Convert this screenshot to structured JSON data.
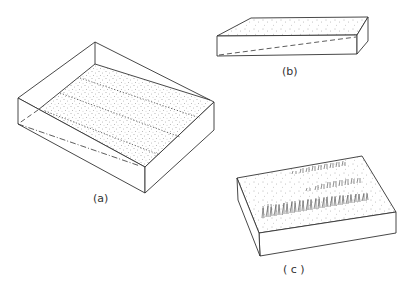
{
  "figure": {
    "panels": [
      {
        "id": "a",
        "label": "(a)",
        "description": "Block with stippled sloping top surface, three dotted contour lines and dashed hidden edges"
      },
      {
        "id": "b",
        "label": "(b)",
        "description": "Thin wedge-shaped block with stippled top and dashed hidden slope line"
      },
      {
        "id": "c",
        "label": "( c )",
        "description": "Block with stippled top surface bearing three bands of grass-like vegetation strokes"
      }
    ],
    "colors": {
      "line": "#333333",
      "background": "#ffffff",
      "stipple": "#555555"
    }
  }
}
